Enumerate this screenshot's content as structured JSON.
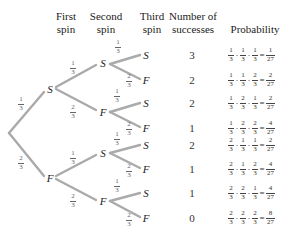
{
  "headers": {
    "first_spin": "First\nspin",
    "second_spin": "Second\nspin",
    "third_spin": "Third\nspin",
    "num_successes": "Number of\nsuccesses",
    "probability": "Probability"
  },
  "colors": {
    "branch": "#aaaaaa",
    "text": "#222222",
    "fraction": "#666666"
  },
  "tree": {
    "level1": [
      {
        "label": "S",
        "prob_num": "1",
        "prob_den": "3"
      },
      {
        "label": "F",
        "prob_num": "2",
        "prob_den": "3"
      }
    ],
    "level2": [
      {
        "label": "S",
        "prob_num": "1",
        "prob_den": "3"
      },
      {
        "label": "F",
        "prob_num": "2",
        "prob_den": "3"
      },
      {
        "label": "S",
        "prob_num": "1",
        "prob_den": "3"
      },
      {
        "label": "F",
        "prob_num": "2",
        "prob_den": "3"
      }
    ],
    "level3": [
      {
        "label": "S",
        "prob_num": "1",
        "prob_den": "3"
      },
      {
        "label": "F",
        "prob_num": "2",
        "prob_den": "3"
      },
      {
        "label": "S",
        "prob_num": "1",
        "prob_den": "3"
      },
      {
        "label": "F",
        "prob_num": "2",
        "prob_den": "3"
      },
      {
        "label": "S",
        "prob_num": "1",
        "prob_den": "3"
      },
      {
        "label": "F",
        "prob_num": "2",
        "prob_den": "3"
      },
      {
        "label": "S",
        "prob_num": "1",
        "prob_den": "3"
      },
      {
        "label": "F",
        "prob_num": "2",
        "prob_den": "3"
      }
    ]
  },
  "outcomes": [
    {
      "successes": "3",
      "factors": [
        "1",
        "1",
        "1"
      ],
      "result_num": "1",
      "result_den": "27"
    },
    {
      "successes": "2",
      "factors": [
        "1",
        "1",
        "2"
      ],
      "result_num": "2",
      "result_den": "27"
    },
    {
      "successes": "2",
      "factors": [
        "1",
        "2",
        "1"
      ],
      "result_num": "2",
      "result_den": "27"
    },
    {
      "successes": "1",
      "factors": [
        "1",
        "2",
        "2"
      ],
      "result_num": "4",
      "result_den": "27"
    },
    {
      "successes": "2",
      "factors": [
        "2",
        "1",
        "1"
      ],
      "result_num": "2",
      "result_den": "27"
    },
    {
      "successes": "1",
      "factors": [
        "2",
        "1",
        "2"
      ],
      "result_num": "4",
      "result_den": "27"
    },
    {
      "successes": "1",
      "factors": [
        "2",
        "2",
        "1"
      ],
      "result_num": "4",
      "result_den": "27"
    },
    {
      "successes": "0",
      "factors": [
        "2",
        "2",
        "2"
      ],
      "result_num": "8",
      "result_den": "27"
    }
  ],
  "denominator": "3",
  "ops": {
    "dot": "·",
    "eq": "="
  }
}
